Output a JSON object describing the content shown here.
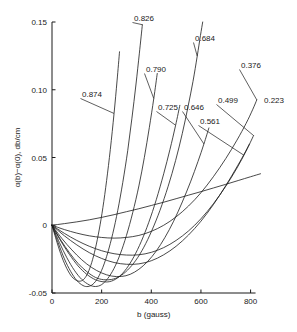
{
  "chart_data": {
    "type": "line",
    "title": "",
    "xlabel": "b (gauss)",
    "ylabel": "α(b)−α(0), db/cm",
    "xlim": [
      0,
      850
    ],
    "ylim": [
      -0.05,
      0.15
    ],
    "xticks": [
      0,
      200,
      400,
      600,
      800
    ],
    "xticklabels": [
      "0",
      "200",
      "400",
      "600",
      "800"
    ],
    "yticks": [
      -0.05,
      0,
      0.05,
      0.1,
      0.15
    ],
    "yticklabels": [
      "-0.05",
      "0",
      "0.05",
      "0.10",
      "0.15"
    ],
    "grid": false,
    "legend_position": "inline-curve-labels",
    "x_unit": "gauss",
    "y_unit": "db/cm",
    "series": [
      {
        "name": "0.874",
        "label": "0.874",
        "label_x": 82,
        "label_y": 97,
        "points": [
          [
            0,
            0
          ],
          [
            20,
            -0.0125
          ],
          [
            40,
            -0.0235
          ],
          [
            60,
            -0.032
          ],
          [
            80,
            -0.038
          ],
          [
            100,
            -0.0408
          ],
          [
            115,
            -0.0412
          ],
          [
            130,
            -0.0395
          ],
          [
            145,
            -0.035
          ],
          [
            160,
            -0.0275
          ],
          [
            175,
            -0.017
          ],
          [
            190,
            -0.0035
          ],
          [
            205,
            0.013
          ],
          [
            220,
            0.033
          ],
          [
            235,
            0.056
          ],
          [
            250,
            0.0825
          ],
          [
            262,
            0.1065
          ],
          [
            272,
            0.128
          ]
        ]
      },
      {
        "name": "0.826",
        "label": "0.826",
        "label_x": 134,
        "label_y": 21,
        "points": [
          [
            0,
            0
          ],
          [
            25,
            -0.013
          ],
          [
            50,
            -0.0248
          ],
          [
            75,
            -0.034
          ],
          [
            100,
            -0.0408
          ],
          [
            125,
            -0.0445
          ],
          [
            145,
            -0.0452
          ],
          [
            165,
            -0.0435
          ],
          [
            185,
            -0.0388
          ],
          [
            205,
            -0.031
          ],
          [
            225,
            -0.02
          ],
          [
            245,
            -0.006
          ],
          [
            265,
            0.011
          ],
          [
            285,
            0.0315
          ],
          [
            305,
            0.055
          ],
          [
            322,
            0.079
          ],
          [
            338,
            0.1035
          ],
          [
            352,
            0.127
          ],
          [
            364,
            0.148
          ]
        ]
      },
      {
        "name": "0.790",
        "label": "0.790",
        "label_x": 146,
        "label_y": 72,
        "points": [
          [
            0,
            0
          ],
          [
            30,
            -0.0128
          ],
          [
            60,
            -0.024
          ],
          [
            90,
            -0.0332
          ],
          [
            120,
            -0.04
          ],
          [
            150,
            -0.044
          ],
          [
            175,
            -0.0452
          ],
          [
            200,
            -0.0438
          ],
          [
            225,
            -0.0392
          ],
          [
            250,
            -0.0318
          ],
          [
            275,
            -0.0212
          ],
          [
            300,
            -0.0075
          ],
          [
            325,
            0.0092
          ],
          [
            350,
            0.029
          ],
          [
            372,
            0.05
          ],
          [
            392,
            0.072
          ],
          [
            410,
            0.0935
          ],
          [
            424,
            0.112
          ]
        ]
      },
      {
        "name": "0.725",
        "label": "0.725",
        "label_x": 158,
        "label_y": 110,
        "points": [
          [
            0,
            0
          ],
          [
            35,
            -0.0115
          ],
          [
            70,
            -0.0215
          ],
          [
            105,
            -0.03
          ],
          [
            140,
            -0.0362
          ],
          [
            175,
            -0.0402
          ],
          [
            210,
            -0.0418
          ],
          [
            240,
            -0.0412
          ],
          [
            270,
            -0.038
          ],
          [
            300,
            -0.032
          ],
          [
            330,
            -0.0232
          ],
          [
            360,
            -0.0118
          ],
          [
            390,
            0.0022
          ],
          [
            420,
            0.0188
          ],
          [
            450,
            0.038
          ],
          [
            475,
            0.0558
          ],
          [
            498,
            0.0738
          ],
          [
            515,
            0.0885
          ]
        ]
      },
      {
        "name": "0.646",
        "label": "0.646",
        "label_x": 184,
        "label_y": 110,
        "points": [
          [
            0,
            0
          ],
          [
            40,
            -0.0098
          ],
          [
            80,
            -0.0182
          ],
          [
            120,
            -0.0255
          ],
          [
            160,
            -0.0312
          ],
          [
            200,
            -0.0352
          ],
          [
            240,
            -0.0375
          ],
          [
            280,
            -0.0378
          ],
          [
            315,
            -0.0362
          ],
          [
            350,
            -0.0325
          ],
          [
            385,
            -0.0268
          ],
          [
            420,
            -0.019
          ],
          [
            455,
            -0.009
          ],
          [
            490,
            0.003
          ],
          [
            525,
            0.0172
          ],
          [
            558,
            0.032
          ],
          [
            588,
            0.047
          ],
          [
            612,
            0.06
          ],
          [
            632,
            0.0718
          ]
        ]
      },
      {
        "name": "0.684",
        "label": "0.684",
        "label_x": 195,
        "label_y": 41,
        "points": [
          [
            0,
            0
          ],
          [
            35,
            -0.0108
          ],
          [
            70,
            -0.0202
          ],
          [
            105,
            -0.0282
          ],
          [
            140,
            -0.0342
          ],
          [
            175,
            -0.0385
          ],
          [
            208,
            -0.0402
          ],
          [
            240,
            -0.04
          ],
          [
            272,
            -0.0378
          ],
          [
            305,
            -0.033
          ],
          [
            338,
            -0.0258
          ],
          [
            370,
            -0.0162
          ],
          [
            402,
            -0.004
          ],
          [
            435,
            0.011
          ],
          [
            468,
            0.0288
          ],
          [
            498,
            0.0478
          ],
          [
            525,
            0.0678
          ],
          [
            548,
            0.0875
          ],
          [
            568,
            0.1062
          ],
          [
            585,
            0.1248
          ],
          [
            598,
            0.14
          ],
          [
            608,
            0.151
          ]
        ]
      },
      {
        "name": "0.561",
        "label": "0.561",
        "label_x": 200,
        "label_y": 124,
        "points": [
          [
            0,
            0
          ],
          [
            50,
            -0.0078
          ],
          [
            100,
            -0.0145
          ],
          [
            150,
            -0.0202
          ],
          [
            200,
            -0.0245
          ],
          [
            250,
            -0.0275
          ],
          [
            300,
            -0.0288
          ],
          [
            350,
            -0.0285
          ],
          [
            400,
            -0.0262
          ],
          [
            450,
            -0.0218
          ],
          [
            500,
            -0.0155
          ],
          [
            550,
            -0.0072
          ],
          [
            600,
            0.003
          ],
          [
            650,
            0.0152
          ],
          [
            700,
            0.0292
          ],
          [
            740,
            0.0415
          ],
          [
            772,
            0.0518
          ],
          [
            795,
            0.0598
          ]
        ]
      },
      {
        "name": "0.499",
        "label": "0.499",
        "label_x": 218,
        "label_y": 103,
        "points": [
          [
            0,
            0
          ],
          [
            50,
            -0.006
          ],
          [
            100,
            -0.0112
          ],
          [
            150,
            -0.0155
          ],
          [
            200,
            -0.0188
          ],
          [
            250,
            -0.021
          ],
          [
            300,
            -0.022
          ],
          [
            350,
            -0.0218
          ],
          [
            400,
            -0.02
          ],
          [
            450,
            -0.0165
          ],
          [
            500,
            -0.0112
          ],
          [
            550,
            -0.0042
          ],
          [
            600,
            0.0048
          ],
          [
            650,
            0.0158
          ],
          [
            700,
            0.0288
          ],
          [
            745,
            0.0422
          ],
          [
            782,
            0.0548
          ],
          [
            812,
            0.0662
          ]
        ]
      },
      {
        "name": "0.376",
        "label": "0.376",
        "label_x": 241,
        "label_y": 68,
        "points": [
          [
            0,
            0
          ],
          [
            50,
            -0.0032
          ],
          [
            100,
            -0.0058
          ],
          [
            150,
            -0.0078
          ],
          [
            200,
            -0.009
          ],
          [
            250,
            -0.0095
          ],
          [
            300,
            -0.009
          ],
          [
            350,
            -0.0075
          ],
          [
            400,
            -0.0045
          ],
          [
            450,
            0.0
          ],
          [
            500,
            0.0062
          ],
          [
            550,
            0.0142
          ],
          [
            600,
            0.024
          ],
          [
            650,
            0.0358
          ],
          [
            700,
            0.0492
          ],
          [
            745,
            0.0628
          ],
          [
            782,
            0.0752
          ],
          [
            808,
            0.0852
          ],
          [
            825,
            0.0925
          ]
        ]
      },
      {
        "name": "0.223",
        "label": "0.223",
        "label_x": 264,
        "label_y": 103,
        "points": [
          [
            0,
            0
          ],
          [
            50,
            0.0012
          ],
          [
            100,
            0.0025
          ],
          [
            150,
            0.004
          ],
          [
            200,
            0.0058
          ],
          [
            250,
            0.0078
          ],
          [
            300,
            0.01
          ],
          [
            350,
            0.0122
          ],
          [
            400,
            0.0146
          ],
          [
            450,
            0.017
          ],
          [
            500,
            0.0196
          ],
          [
            550,
            0.0222
          ],
          [
            600,
            0.0248
          ],
          [
            650,
            0.0275
          ],
          [
            700,
            0.0302
          ],
          [
            750,
            0.033
          ],
          [
            800,
            0.0358
          ],
          [
            840,
            0.038
          ]
        ]
      }
    ]
  }
}
